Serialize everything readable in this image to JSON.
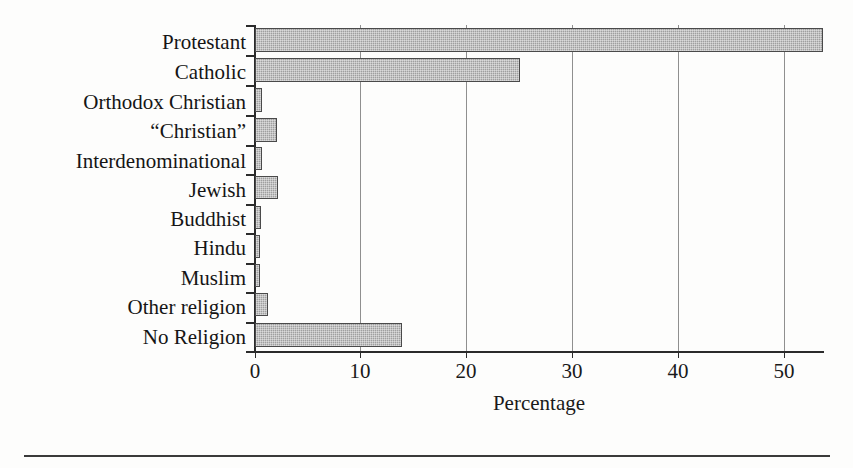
{
  "chart_data": {
    "type": "bar",
    "orientation": "horizontal",
    "title": "",
    "xlabel": "Percentage",
    "ylabel": "",
    "xlim": [
      0,
      54
    ],
    "xticks": [
      0,
      10,
      20,
      30,
      40,
      50
    ],
    "xtick_labels": [
      "0",
      "10",
      "20",
      "30",
      "40",
      "50"
    ],
    "grid": "vertical",
    "legend": "none",
    "bar_fill_color": "#a9a9a9",
    "bar_edge_color": "#4a4a4a",
    "categories": [
      "Protestant",
      "Catholic",
      "Orthodox Christian",
      "“Christian”",
      "Interdenominational",
      "Jewish",
      "Buddhist",
      "Hindu",
      "Muslim",
      "Other religion",
      "No Religion"
    ],
    "values": [
      53.7,
      25.0,
      0.7,
      2.1,
      0.7,
      2.2,
      0.6,
      0.5,
      0.5,
      1.2,
      13.9
    ]
  },
  "axis": {
    "x_title": "Percentage"
  }
}
